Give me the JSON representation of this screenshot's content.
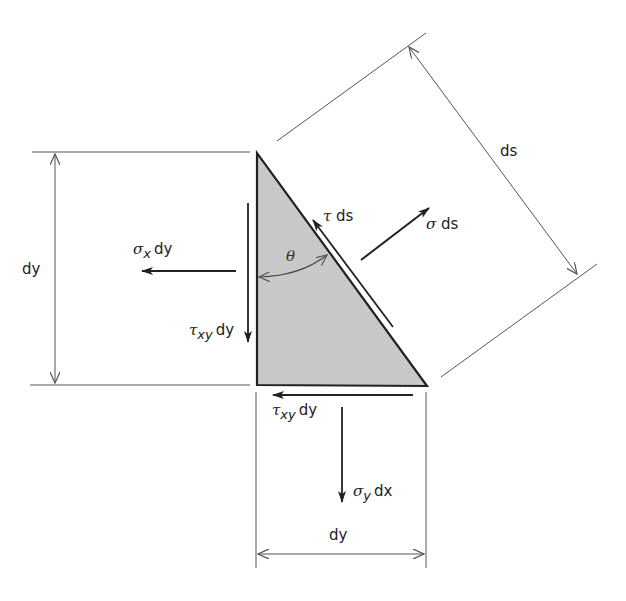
{
  "diagram": {
    "colors": {
      "line": "#2a2a2a",
      "dim_line": "#555555",
      "wedge_fill": "#c8c8c8",
      "background": "#ffffff"
    },
    "wedge": {
      "vertices": [
        [
          257,
          153
        ],
        [
          257,
          385
        ],
        [
          427,
          386
        ]
      ],
      "angle_label": "θ"
    },
    "dimensions": {
      "left": {
        "label": "dy"
      },
      "bottom": {
        "label": "dy"
      },
      "hypotenuse": {
        "label": "ds"
      }
    },
    "forces": {
      "sigma_x": {
        "symbol": "σ",
        "subscript": "x",
        "suffix": "dy"
      },
      "tau_xy_vertical": {
        "symbol": "τ",
        "subscript": "xy",
        "suffix": "dy"
      },
      "tau_xy_horizontal": {
        "symbol": "τ",
        "subscript": "xy",
        "suffix": "dy"
      },
      "sigma_y": {
        "symbol": "σ",
        "subscript": "y",
        "suffix": "dx"
      },
      "sigma_n": {
        "symbol": "σ",
        "suffix": "ds"
      },
      "tau_n": {
        "symbol": "τ",
        "suffix": "ds"
      }
    }
  }
}
